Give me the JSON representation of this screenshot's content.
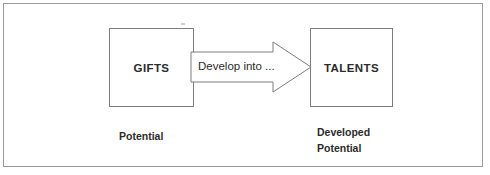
{
  "diagram": {
    "background_color": "#ffffff",
    "frame": {
      "name": "outer-frame",
      "border_color": "#9a9a9a"
    },
    "nodes": [
      {
        "id": "gifts",
        "label": "GIFTS",
        "caption": "Potential",
        "border_color": "#7d7d7d",
        "fill_color": "#ffffff"
      },
      {
        "id": "talents",
        "label": "TALENTS",
        "caption_lines": [
          "Developed",
          "Potential"
        ],
        "border_color": "#7d7d7d",
        "fill_color": "#ffffff"
      }
    ],
    "connector": {
      "id": "develop-arrow",
      "label": "Develop into ...",
      "direction": "right",
      "from": "gifts",
      "to": "talents",
      "stroke_color": "#7d7d7d",
      "fill_color": "#ffffff"
    }
  }
}
